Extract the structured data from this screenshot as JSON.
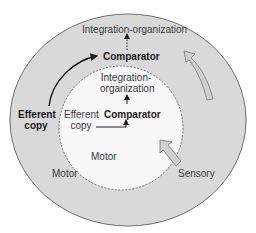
{
  "diagram": {
    "outer_ellipse": {
      "top_label": "Integration-organization",
      "comparator": "Comparator",
      "efferent_copy": [
        "Efferent",
        "copy"
      ],
      "motor": "Motor",
      "sensory": "Sensory"
    },
    "inner_ellipse": {
      "integration": [
        "Integration-",
        "organization"
      ],
      "comparator": "Comparator",
      "efferent_copy": [
        "Efferent",
        "copy"
      ],
      "motor": "Motor"
    },
    "colors": {
      "outer_fill": "#d9d9d9",
      "inner_fill": "#f7f7f7",
      "arrow_fill": "#cfcfcf",
      "stroke": "#666666"
    }
  }
}
